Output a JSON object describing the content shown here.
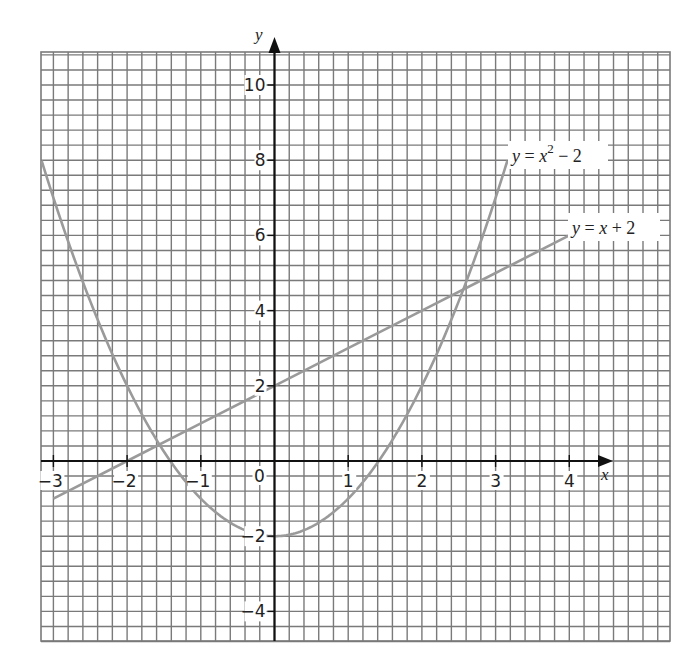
{
  "chart_data": {
    "type": "line",
    "title": "",
    "xlabel": "x",
    "ylabel": "y",
    "xlim": [
      -3.2,
      5.3
    ],
    "ylim": [
      -4.8,
      10.8
    ],
    "grid": true,
    "grid_minor_x": 0.2,
    "grid_minor_y": 0.4,
    "x_ticks": [
      -3,
      -2,
      -1,
      0,
      1,
      2,
      3,
      4
    ],
    "y_ticks": [
      -4,
      -2,
      0,
      2,
      4,
      6,
      8,
      10
    ],
    "series": [
      {
        "name": "y = x^2 - 2",
        "label": "y = x² − 2",
        "expression": "x^2 - 2",
        "x_range": [
          -3.16,
          3.16
        ],
        "points": [
          [
            -3.16,
            7.99
          ],
          [
            -3,
            7
          ],
          [
            -2.5,
            4.25
          ],
          [
            -2,
            2
          ],
          [
            -1.5,
            0.25
          ],
          [
            -1,
            -1
          ],
          [
            -0.5,
            -1.75
          ],
          [
            0,
            -2
          ],
          [
            0.5,
            -1.75
          ],
          [
            1,
            -1
          ],
          [
            1.5,
            0.25
          ],
          [
            2,
            2
          ],
          [
            2.5,
            4.25
          ],
          [
            3,
            7
          ],
          [
            3.16,
            7.99
          ]
        ],
        "color": "#9a9a9a"
      },
      {
        "name": "y = x + 2",
        "label": "y = x + 2",
        "expression": "x + 2",
        "x_range": [
          -3,
          4
        ],
        "points": [
          [
            -3,
            -1
          ],
          [
            -2,
            0
          ],
          [
            -1,
            1
          ],
          [
            0,
            2
          ],
          [
            1,
            3
          ],
          [
            2,
            4
          ],
          [
            3,
            5
          ],
          [
            4,
            6
          ]
        ],
        "color": "#9a9a9a"
      }
    ],
    "annotations": [
      {
        "type": "intersection",
        "x": -1.56,
        "y": 0.44
      },
      {
        "type": "intersection",
        "x": 2.56,
        "y": 4.56
      }
    ]
  },
  "labels": {
    "x_axis": "x",
    "y_axis": "y",
    "origin": "0",
    "x_ticks": [
      "−3",
      "−2",
      "−1",
      "1",
      "2",
      "3",
      "4"
    ],
    "y_ticks": [
      "10",
      "8",
      "6",
      "4",
      "2",
      "−2",
      "−4"
    ],
    "curve1": {
      "y": "y",
      "eq": " = ",
      "x": "x",
      "sup": "2",
      "rest": " − 2"
    },
    "curve2": {
      "y": "y",
      "eq": " = ",
      "x": "x",
      "rest": " + 2"
    }
  },
  "colors": {
    "grid": "#7a7a7a",
    "axis": "#111111",
    "curve": "#9a9a9a",
    "background": "#ffffff"
  }
}
